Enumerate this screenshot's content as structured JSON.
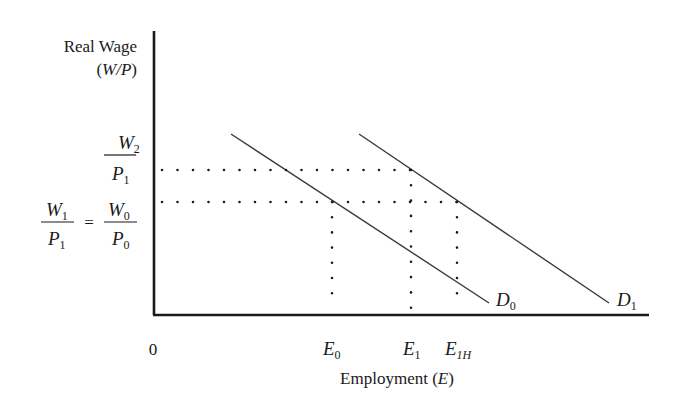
{
  "diagram": {
    "y_axis_label_line1": "Real Wage",
    "y_axis_label_line2": "(W/P)",
    "y_axis_label_var": "W/P",
    "x_axis_label": "Employment",
    "x_axis_label_var": "E",
    "origin_label": "0",
    "y_ticks": {
      "upper": {
        "num": "W",
        "num_sub": "2",
        "den": "P",
        "den_sub": "1"
      },
      "lower_left": {
        "num": "W",
        "num_sub": "1",
        "den": "P",
        "den_sub": "1"
      },
      "equals": "=",
      "lower_right": {
        "num": "W",
        "num_sub": "0",
        "den": "P",
        "den_sub": "0"
      }
    },
    "x_ticks": [
      {
        "main": "E",
        "sub": "0"
      },
      {
        "main": "E",
        "sub": "1"
      },
      {
        "main": "E",
        "sub": "1H"
      }
    ],
    "curves": [
      {
        "main": "D",
        "sub": "0"
      },
      {
        "main": "D",
        "sub": "1"
      }
    ],
    "colors": {
      "ink": "#1a1a1a",
      "curve": "#3a3a3a",
      "background": "#ffffff"
    }
  }
}
